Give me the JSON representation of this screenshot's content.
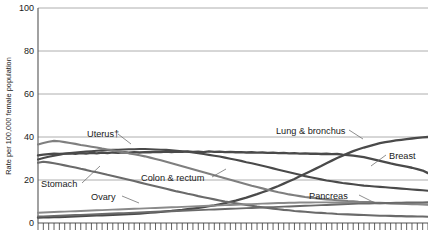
{
  "chart_data": {
    "type": "line",
    "title": "",
    "xlabel": "",
    "ylabel": "Rate per 100,000 female population",
    "ylim": [
      0,
      100
    ],
    "yticks": [
      0,
      20,
      40,
      60,
      80,
      100
    ],
    "ytick_labels": [
      "0",
      "20",
      "40",
      "60",
      "80",
      "100"
    ],
    "grid": true,
    "legend_position": "inline-labels",
    "xlim": [
      1930,
      2003
    ],
    "xticks_count": 74,
    "xtick_labels_visible": false,
    "x": [
      1930,
      1931,
      1932,
      1933,
      1934,
      1935,
      1936,
      1937,
      1938,
      1939,
      1940,
      1941,
      1942,
      1943,
      1944,
      1945,
      1946,
      1947,
      1948,
      1949,
      1950,
      1951,
      1952,
      1953,
      1954,
      1955,
      1956,
      1957,
      1958,
      1959,
      1960,
      1961,
      1962,
      1963,
      1964,
      1965,
      1966,
      1967,
      1968,
      1969,
      1970,
      1971,
      1972,
      1973,
      1974,
      1975,
      1976,
      1977,
      1978,
      1979,
      1980,
      1981,
      1982,
      1983,
      1984,
      1985,
      1986,
      1987,
      1988,
      1989,
      1990,
      1991,
      1992,
      1993,
      1994,
      1995,
      1996,
      1997,
      1998,
      1999,
      2000,
      2001,
      2002,
      2003
    ],
    "series": [
      {
        "name": "Lung & bronchus",
        "color": "#4a4a4a",
        "width": 2.3,
        "label_x": 277,
        "label_y": 132,
        "values": [
          2.5,
          2.6,
          2.6,
          2.7,
          2.8,
          2.9,
          3.0,
          3.1,
          3.2,
          3.3,
          3.4,
          3.5,
          3.6,
          3.7,
          3.8,
          3.9,
          4.0,
          4.1,
          4.3,
          4.4,
          4.6,
          4.8,
          5.0,
          5.2,
          5.4,
          5.6,
          5.9,
          6.1,
          6.4,
          6.7,
          7.0,
          7.4,
          7.8,
          8.2,
          8.7,
          9.2,
          9.8,
          10.4,
          11.1,
          11.8,
          12.6,
          13.4,
          14.3,
          15.2,
          16.2,
          17.2,
          18.3,
          19.4,
          20.5,
          21.7,
          22.9,
          24.1,
          25.3,
          26.5,
          27.8,
          29.0,
          30.2,
          31.3,
          32.4,
          33.4,
          34.3,
          35.1,
          35.8,
          36.5,
          37.1,
          37.6,
          38.0,
          38.4,
          38.7,
          39.0,
          39.3,
          39.6,
          39.8,
          40.0
        ]
      },
      {
        "name": "Breast",
        "color": "#4a4a4a",
        "width": 2.3,
        "label_x": 389,
        "label_y": 157,
        "values": [
          31.5,
          31.8,
          32.0,
          32.2,
          32.1,
          32.3,
          32.4,
          32.2,
          32.5,
          32.3,
          32.6,
          32.4,
          32.7,
          32.5,
          32.8,
          32.6,
          32.9,
          32.7,
          33.0,
          32.8,
          33.0,
          32.9,
          33.1,
          33.0,
          33.2,
          33.0,
          33.2,
          33.1,
          33.3,
          33.1,
          33.2,
          33.0,
          33.3,
          33.1,
          33.2,
          33.0,
          33.1,
          32.9,
          33.0,
          32.8,
          32.9,
          32.7,
          32.8,
          32.6,
          32.7,
          32.5,
          32.6,
          32.4,
          32.5,
          32.3,
          32.4,
          32.2,
          32.3,
          32.1,
          32.2,
          32.0,
          32.1,
          31.8,
          31.6,
          31.3,
          31.0,
          30.6,
          30.1,
          29.5,
          28.9,
          28.3,
          27.7,
          27.2,
          26.7,
          26.2,
          25.7,
          25.1,
          24.4,
          23.2
        ]
      },
      {
        "name": "Colon & rectum",
        "color": "#4a4a4a",
        "width": 2.1,
        "label_x": 150,
        "label_y": 180,
        "values": [
          29.5,
          30.2,
          30.8,
          31.3,
          31.8,
          32.2,
          32.5,
          32.8,
          33.0,
          33.2,
          33.4,
          33.6,
          33.8,
          33.9,
          34.0,
          34.1,
          34.2,
          34.3,
          34.3,
          34.4,
          34.4,
          34.3,
          34.2,
          34.1,
          34.0,
          33.8,
          33.6,
          33.4,
          33.1,
          32.8,
          32.5,
          32.1,
          31.7,
          31.3,
          30.9,
          30.4,
          29.9,
          29.4,
          28.9,
          28.3,
          27.8,
          27.2,
          26.6,
          26.0,
          25.4,
          24.8,
          24.2,
          23.6,
          23.0,
          22.4,
          21.8,
          21.3,
          20.8,
          20.3,
          19.8,
          19.4,
          19.0,
          18.6,
          18.3,
          18.0,
          17.7,
          17.4,
          17.2,
          17.0,
          16.8,
          16.6,
          16.4,
          16.2,
          16.0,
          15.8,
          15.6,
          15.4,
          15.2,
          15.0
        ]
      },
      {
        "name": "Uterus",
        "label_display": "Uterus†",
        "color": "#7f7f7f",
        "width": 2.1,
        "label_x": 93,
        "label_y": 134,
        "values": [
          36.5,
          37.2,
          37.8,
          38.2,
          38.0,
          37.6,
          37.2,
          36.8,
          36.3,
          35.9,
          35.5,
          35.1,
          34.6,
          34.2,
          33.8,
          33.3,
          32.9,
          32.4,
          32.0,
          31.5,
          31.0,
          30.4,
          29.8,
          29.2,
          28.5,
          27.8,
          27.1,
          26.4,
          25.7,
          25.0,
          24.3,
          23.6,
          22.9,
          22.2,
          21.5,
          20.8,
          20.1,
          19.4,
          18.7,
          18.0,
          17.3,
          16.7,
          16.1,
          15.5,
          14.9,
          14.3,
          13.8,
          13.3,
          12.9,
          12.5,
          12.1,
          11.8,
          11.5,
          11.2,
          11.0,
          10.8,
          10.6,
          10.4,
          10.2,
          10.1,
          9.9,
          9.8,
          9.7,
          9.5,
          9.4,
          9.3,
          9.2,
          9.1,
          9.0,
          8.9,
          8.8,
          8.7,
          8.6,
          8.5
        ]
      },
      {
        "name": "Stomach",
        "color": "#6a6a6a",
        "width": 2.1,
        "label_x": 42,
        "label_y": 186,
        "values": [
          28.0,
          28.5,
          28.2,
          27.8,
          27.3,
          26.8,
          26.3,
          25.8,
          25.2,
          24.7,
          24.1,
          23.6,
          23.0,
          22.4,
          21.9,
          21.3,
          20.7,
          20.1,
          19.5,
          18.9,
          18.3,
          17.7,
          17.1,
          16.5,
          15.9,
          15.3,
          14.7,
          14.2,
          13.6,
          13.1,
          12.5,
          12.0,
          11.5,
          11.0,
          10.5,
          10.0,
          9.6,
          9.2,
          8.8,
          8.4,
          8.0,
          7.6,
          7.3,
          7.0,
          6.7,
          6.4,
          6.1,
          5.9,
          5.6,
          5.4,
          5.2,
          5.0,
          4.8,
          4.7,
          4.5,
          4.4,
          4.2,
          4.1,
          4.0,
          3.9,
          3.8,
          3.7,
          3.6,
          3.5,
          3.4,
          3.4,
          3.3,
          3.2,
          3.2,
          3.1,
          3.1,
          3.0,
          3.0,
          2.9
        ]
      },
      {
        "name": "Ovary",
        "color": "#8a8a8a",
        "width": 1.9,
        "label_x": 96,
        "label_y": 198,
        "values": [
          4.8,
          4.9,
          5.0,
          5.1,
          5.2,
          5.3,
          5.4,
          5.5,
          5.6,
          5.7,
          5.8,
          5.9,
          6.0,
          6.1,
          6.2,
          6.3,
          6.4,
          6.5,
          6.6,
          6.7,
          6.8,
          6.9,
          7.0,
          7.1,
          7.2,
          7.3,
          7.4,
          7.5,
          7.6,
          7.7,
          7.8,
          7.9,
          8.0,
          8.1,
          8.2,
          8.3,
          8.4,
          8.5,
          8.6,
          8.7,
          8.8,
          8.9,
          9.0,
          9.1,
          9.2,
          9.3,
          9.3,
          9.4,
          9.4,
          9.5,
          9.5,
          9.5,
          9.6,
          9.6,
          9.6,
          9.5,
          9.5,
          9.5,
          9.4,
          9.4,
          9.4,
          9.3,
          9.3,
          9.3,
          9.2,
          9.2,
          9.1,
          9.1,
          9.0,
          9.0,
          8.9,
          8.9,
          8.8,
          8.8
        ]
      },
      {
        "name": "Pancreas",
        "color": "#6a6a6a",
        "width": 1.9,
        "label_x": 312,
        "label_y": 193,
        "values": [
          3.0,
          3.1,
          3.2,
          3.3,
          3.4,
          3.5,
          3.6,
          3.7,
          3.8,
          3.9,
          4.0,
          4.1,
          4.2,
          4.3,
          4.4,
          4.5,
          4.6,
          4.7,
          4.8,
          4.9,
          5.0,
          5.1,
          5.2,
          5.3,
          5.4,
          5.5,
          5.6,
          5.7,
          5.8,
          5.9,
          6.0,
          6.1,
          6.2,
          6.3,
          6.4,
          6.5,
          6.6,
          6.7,
          6.8,
          6.9,
          7.0,
          7.1,
          7.2,
          7.3,
          7.4,
          7.5,
          7.6,
          7.7,
          7.8,
          7.9,
          8.0,
          8.1,
          8.2,
          8.3,
          8.4,
          8.5,
          8.6,
          8.7,
          8.8,
          8.9,
          9.0,
          9.1,
          9.1,
          9.2,
          9.2,
          9.3,
          9.3,
          9.4,
          9.4,
          9.5,
          9.5,
          9.6,
          9.6,
          9.7
        ]
      }
    ],
    "annotations": [
      {
        "text": "Lung & bronchus",
        "anchor": "line",
        "series": "Lung & bronchus"
      },
      {
        "text": "Breast",
        "anchor": "line",
        "series": "Breast"
      },
      {
        "text": "Colon & rectum",
        "anchor": "line",
        "series": "Colon & rectum"
      },
      {
        "text": "Uterus†",
        "anchor": "line",
        "series": "Uterus"
      },
      {
        "text": "Stomach",
        "anchor": "line",
        "series": "Stomach"
      },
      {
        "text": "Ovary",
        "anchor": "line",
        "series": "Ovary"
      },
      {
        "text": "Pancreas",
        "anchor": "line",
        "series": "Pancreas"
      }
    ]
  },
  "labels": {
    "y_axis_title": "Rate per 100,000 female population",
    "lung": "Lung & bronchus",
    "breast": "Breast",
    "colon": "Colon & rectum",
    "uterus": "Uterus†",
    "stomach": "Stomach",
    "ovary": "Ovary",
    "pancreas": "Pancreas",
    "y0": "0",
    "y20": "20",
    "y40": "40",
    "y60": "60",
    "y80": "80",
    "y100": "100"
  }
}
